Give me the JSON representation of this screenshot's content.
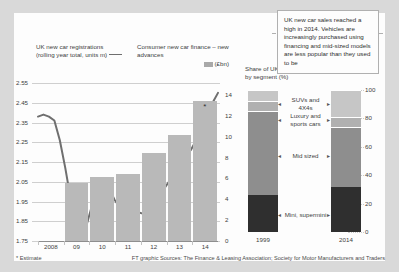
{
  "left_chart": {
    "line_title_l1": "UK new car registrations",
    "line_title_l2": "(rolling year total, units m)",
    "bars_legend_l1": "Consumer new car finance – new advances",
    "bars_legend_l2": "(£bn)"
  },
  "right_chart": {
    "title_l1": "Share of UK new car market,",
    "title_l2": "by segment (%)"
  },
  "callout": {
    "text": "UK new car sales reached a high in 2014. Vehicles are increasingly purchased using financing and mid-sized models are less popular than they used to be"
  },
  "footer": {
    "estimate_note": "* Estimate",
    "source": "FT graphic Sources: The Finance & Leasing Association; Society for Motor Manufacturers and Traders"
  },
  "colors": {
    "bar_fill": "#b9b9b9",
    "line": "#6f6f6f",
    "seg_suv": "#c6c6c6",
    "seg_luxury": "#b0b0b0",
    "seg_mid": "#8e8e8e",
    "seg_mini": "#2f2f2f",
    "card_bg": "#fdfdfd",
    "page_bg": "#d9d9d9"
  },
  "chart_data": [
    {
      "type": "bar",
      "id": "uk-car-finance-and-registrations",
      "title": "UK new car registrations (rolling year total, units m) / Consumer new car finance – new advances (£bn)",
      "xlabel": "",
      "categories": [
        "2008",
        "09",
        "10",
        "11",
        "12",
        "13",
        "14"
      ],
      "ylabel_left": "UK new car registrations (rolling year total, units m)",
      "ylim_left": [
        1.75,
        2.55
      ],
      "yticks_left": [
        "2.55",
        "2.45",
        "2.35",
        "2.25",
        "2.15",
        "2.05",
        "1.95",
        "1.85",
        "1.75"
      ],
      "ylabel_right": "Consumer new car finance – new advances (£bn)",
      "ylim_right": [
        0,
        14
      ],
      "yticks_right": [
        "14",
        "12",
        "10",
        "8",
        "6",
        "4",
        "2",
        "0"
      ],
      "grid": true,
      "legend_position": "top",
      "annotations": [
        "* Estimate on 2014 bar"
      ],
      "series": [
        {
          "name": "Consumer new car finance – new advances (£bn)",
          "type": "bar",
          "axis": "right",
          "values": [
            0,
            5.6,
            6.1,
            6.4,
            8.4,
            10.2,
            13.4
          ]
        },
        {
          "name": "UK new car registrations (rolling year total, units m)",
          "type": "line",
          "axis": "left",
          "x": [
            "2008",
            "2008.2",
            "2008.4",
            "2008.6",
            "2008.8",
            "2009",
            "2009.2",
            "2009.4",
            "2009.6",
            "2009.8",
            "2010",
            "2010.2",
            "2010.4",
            "2010.6",
            "2010.8",
            "2011",
            "2011.2",
            "2011.4",
            "2011.6",
            "2011.8",
            "2012",
            "2012.2",
            "2012.4",
            "2012.6",
            "2012.8",
            "2013",
            "2013.2",
            "2013.4",
            "2013.6",
            "2013.8",
            "2014",
            "2014.3",
            "2014.6",
            "2014.9"
          ],
          "values": [
            2.38,
            2.39,
            2.38,
            2.36,
            2.26,
            2.12,
            1.96,
            1.84,
            1.8,
            1.84,
            1.94,
            2.03,
            2.06,
            2.02,
            1.96,
            1.92,
            1.9,
            1.91,
            1.9,
            1.89,
            1.9,
            1.93,
            1.97,
            2.01,
            2.05,
            2.08,
            2.14,
            2.18,
            2.21,
            2.26,
            2.32,
            2.39,
            2.45,
            2.5
          ]
        }
      ]
    },
    {
      "type": "bar",
      "id": "uk-car-market-share-by-segment",
      "title": "Share of UK new car market, by segment (%)",
      "stacked": true,
      "xlabel": "",
      "ylabel": "Share of UK new car market, by segment (%)",
      "ylim": [
        0,
        100
      ],
      "yticks": [
        "100",
        "80",
        "60",
        "40",
        "20",
        "0"
      ],
      "categories": [
        "1999",
        "2014"
      ],
      "grid": true,
      "legend_position": "right-labels",
      "series": [
        {
          "name": "Mini, supermini",
          "values": [
            26,
            32
          ],
          "color": "#2f2f2f"
        },
        {
          "name": "Mid sized",
          "values": [
            59,
            42
          ],
          "color": "#8e8e8e"
        },
        {
          "name": "Luxury and sports cars",
          "values": [
            7,
            7
          ],
          "color": "#b0b0b0"
        },
        {
          "name": "SUVs and 4X4s",
          "values": [
            8,
            19
          ],
          "color": "#c6c6c6"
        }
      ],
      "segment_labels": [
        "SUVs and",
        "4X4s",
        "Luxury and",
        "sports cars",
        "Mid sized",
        "Mini, supermini"
      ]
    }
  ]
}
